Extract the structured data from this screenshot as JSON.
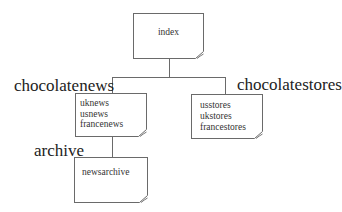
{
  "diagram": {
    "root": {
      "label": "index"
    },
    "groups": [
      {
        "label": "chocolatenews",
        "pages": [
          "uknews",
          "usnews",
          "francenews"
        ]
      },
      {
        "label": "chocolatestores",
        "pages": [
          "usstores",
          "ukstores",
          "francestores"
        ]
      },
      {
        "label": "archive",
        "pages": [
          "newsarchive"
        ]
      }
    ]
  },
  "colors": {
    "line": "#6a6a6a",
    "text": "#222222",
    "background": "#ffffff"
  }
}
